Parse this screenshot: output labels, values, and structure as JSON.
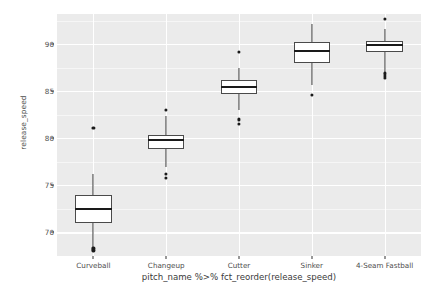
{
  "chart_data": {
    "type": "box",
    "title": "",
    "xlabel": "pitch_name %>% fct_reorder(release_speed)",
    "ylabel": "release_speed",
    "categories": [
      "Curveball",
      "Changeup",
      "Cutter",
      "Sinker",
      "4-Seam Fastball"
    ],
    "ylim": [
      67.5,
      93.2
    ],
    "yticks": [
      70,
      75,
      80,
      85,
      90
    ],
    "ytick_labels": [
      "70",
      "75",
      "80",
      "85",
      "90"
    ],
    "yticks_minor": [
      67.5,
      72.5,
      77.5,
      82.5,
      87.5,
      92.5
    ],
    "grid": true,
    "legend": "none",
    "panel_background": "#ebebeb",
    "gridline_color": "#ffffff",
    "box_fill": "#ffffff",
    "box_line_color": "#4a4a4a",
    "median_color": "#1a1a1a",
    "outlier_color": "#1a1a1a",
    "boxes": [
      {
        "category": "Curveball",
        "whisker_low": 68.5,
        "q1": 71.0,
        "median": 72.5,
        "q3": 74.0,
        "whisker_high": 76.2,
        "outliers": [
          81.1,
          68.3,
          68.1
        ]
      },
      {
        "category": "Changeup",
        "whisker_low": 77.0,
        "q1": 78.9,
        "median": 79.8,
        "q3": 80.3,
        "whisker_high": 82.4,
        "outliers": [
          83.0,
          76.2,
          75.8
        ]
      },
      {
        "category": "Cutter",
        "whisker_low": 83.0,
        "q1": 84.7,
        "median": 85.4,
        "q3": 86.2,
        "whisker_high": 87.5,
        "outliers": [
          89.2,
          82.0,
          81.5
        ]
      },
      {
        "category": "Sinker",
        "whisker_low": 85.7,
        "q1": 88.0,
        "median": 89.3,
        "q3": 90.2,
        "whisker_high": 92.1,
        "outliers": [
          84.6
        ]
      },
      {
        "category": "4-Seam Fastball",
        "whisker_low": 86.3,
        "q1": 89.2,
        "median": 89.9,
        "q3": 90.3,
        "whisker_high": 91.6,
        "outliers": [
          92.7,
          86.9,
          86.6,
          86.4
        ]
      }
    ]
  }
}
